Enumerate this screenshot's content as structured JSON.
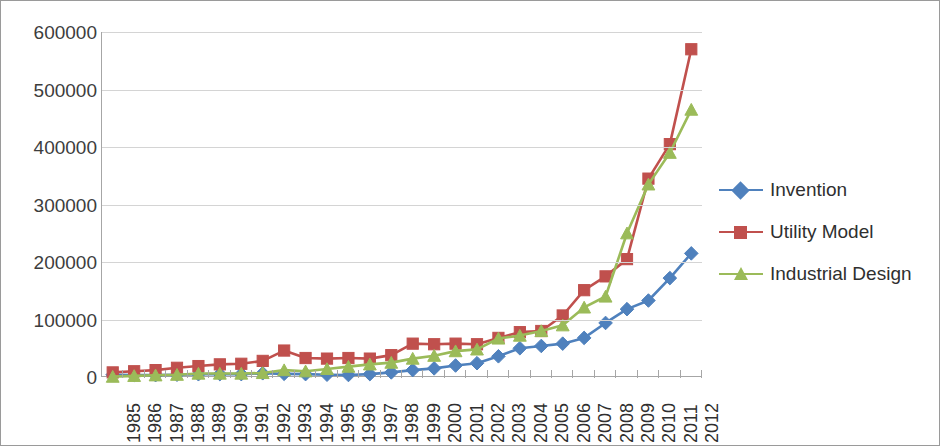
{
  "chart_data": {
    "type": "line",
    "title": "",
    "xlabel": "",
    "ylabel": "",
    "grid": true,
    "legend_position": "right",
    "ylim": [
      0,
      600000
    ],
    "ytick_labels": [
      "600000",
      "500000",
      "400000",
      "300000",
      "200000",
      "100000",
      "0"
    ],
    "ytick_values": [
      600000,
      500000,
      400000,
      300000,
      200000,
      100000,
      0
    ],
    "categories": [
      "1985",
      "1986",
      "1987",
      "1988",
      "1989",
      "1990",
      "1991",
      "1992",
      "1993",
      "1994",
      "1995",
      "1996",
      "1997",
      "1998",
      "1999",
      "2000",
      "2001",
      "2002",
      "2003",
      "2004",
      "2005",
      "2006",
      "2007",
      "2008",
      "2009",
      "2010",
      "2011",
      "2012"
    ],
    "series": [
      {
        "name": "Invention",
        "color": "#4F81BD",
        "marker": "diamond",
        "values": [
          4000,
          3500,
          3200,
          4000,
          4800,
          5000,
          5000,
          6500,
          5500,
          5000,
          4000,
          3500,
          5000,
          8000,
          12000,
          15000,
          20000,
          24000,
          36000,
          50000,
          54000,
          58000,
          68000,
          94000,
          118000,
          133000,
          172000,
          215000
        ]
      },
      {
        "name": "Utility Model",
        "color": "#C0504D",
        "marker": "square",
        "values": [
          8000,
          10000,
          12000,
          16000,
          19000,
          22000,
          23000,
          28000,
          46000,
          33000,
          32000,
          33000,
          32000,
          38000,
          58000,
          57000,
          58000,
          57000,
          68000,
          78000,
          80000,
          107000,
          151000,
          175000,
          205000,
          345000,
          405000,
          570000
        ]
      },
      {
        "name": "Industrial Design",
        "color": "#9BBB59",
        "marker": "triangle",
        "values": [
          600,
          2000,
          3000,
          4000,
          6000,
          6000,
          6000,
          7000,
          12000,
          10000,
          14000,
          18000,
          22000,
          25000,
          32000,
          37000,
          45000,
          48000,
          67000,
          72000,
          80000,
          90000,
          121000,
          140000,
          250000,
          335000,
          390000,
          465000
        ]
      }
    ]
  },
  "legend": {
    "items": [
      {
        "label": "Invention"
      },
      {
        "label": "Utility Model"
      },
      {
        "label": "Industrial Design"
      }
    ]
  }
}
